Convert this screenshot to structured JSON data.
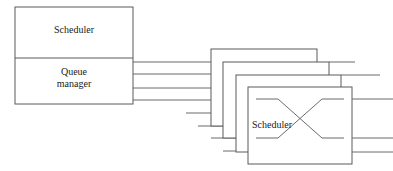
{
  "diagram": {
    "stroke_color": "#5a5a5a",
    "wire_color": "#6b6b6b",
    "background_color": "#ffffff",
    "text_color": "#1a1a1a",
    "left_unit": {
      "name": "scheduler-queue-unit",
      "top_section_label": "Scheduler",
      "bottom_section_label": "Queue\nmanager",
      "bottom_section_label_line1": "Queue",
      "bottom_section_label_line2": "manager",
      "x": 15,
      "y": 7,
      "width": 118,
      "height": 97,
      "divider_y": 58
    },
    "bus": {
      "name": "queue-manager-output-bus",
      "line_count": 4,
      "y_positions": [
        62,
        74,
        88,
        100
      ],
      "x_start": 133
    },
    "node_stack": {
      "name": "scheduler-node-stack",
      "count": 4,
      "offset_x": 12,
      "offset_y": 13,
      "front_label": "Scheduler",
      "boxes": [
        {
          "id": "node-back-1",
          "left": 211,
          "top": 49,
          "right": 317,
          "bottom": 126
        },
        {
          "id": "node-back-2",
          "left": 223,
          "top": 62,
          "right": 329,
          "bottom": 138
        },
        {
          "id": "node-back-3",
          "left": 236,
          "top": 75,
          "right": 341,
          "bottom": 152
        },
        {
          "id": "node-front",
          "left": 248,
          "top": 87,
          "right": 352,
          "bottom": 164
        }
      ]
    },
    "crossbar": {
      "name": "crossbar-x-symbol",
      "description": "X shaped crossing lines inside front scheduler node",
      "left_ports_y": [
        99,
        138
      ],
      "right_ports_y": [
        99,
        138
      ]
    },
    "output_stubs": {
      "name": "node-output-stubs",
      "y_positions": [
        75,
        99,
        138,
        152
      ],
      "x_end": 393
    }
  }
}
